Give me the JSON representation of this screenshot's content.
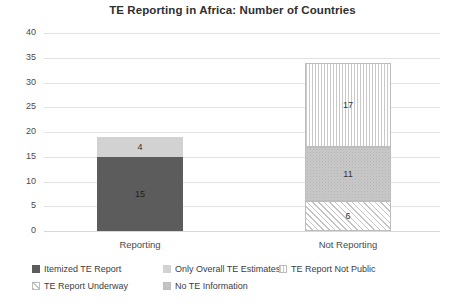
{
  "chart_data": {
    "type": "bar",
    "title": "TE Reporting in Africa: Number of Countries",
    "xlabel": "",
    "ylabel": "",
    "ylim": [
      0,
      40
    ],
    "yticks": [
      "0",
      "5",
      "10",
      "15",
      "20",
      "25",
      "30",
      "35",
      "40"
    ],
    "grid": true,
    "stacked": true,
    "legend_position": "bottom",
    "categories": [
      "Reporting",
      "Not Reporting"
    ],
    "series": [
      {
        "name": "Itemized TE Report",
        "values": [
          15,
          0
        ],
        "swatch": "#5c5c5c",
        "pattern": "solid-dark"
      },
      {
        "name": "Only Overall TE Estimates",
        "values": [
          4,
          0
        ],
        "swatch": "#d2d2d2",
        "pattern": "solid-light"
      },
      {
        "name": "TE Report Not Public",
        "values": [
          0,
          17
        ],
        "swatch": "#ffffff",
        "pattern": "vertical-stripes"
      },
      {
        "name": "TE Report Underway",
        "values": [
          0,
          6
        ],
        "swatch": "#ffffff",
        "pattern": "diagonal-hatch"
      },
      {
        "name": "No TE Information",
        "values": [
          0,
          11
        ],
        "swatch": "#c8c8c8",
        "pattern": "stipple"
      }
    ],
    "bars": [
      {
        "category": "Reporting",
        "total": 19,
        "segments": [
          {
            "label": "15",
            "value": 15,
            "series": "Itemized TE Report",
            "base": 0,
            "fill": "fill-dark"
          },
          {
            "label": "4",
            "value": 4,
            "series": "Only Overall TE Estimates",
            "base": 15,
            "fill": "fill-light"
          }
        ]
      },
      {
        "category": "Not Reporting",
        "total": 34,
        "segments": [
          {
            "label": "6",
            "value": 6,
            "series": "TE Report Underway",
            "base": 0,
            "fill": "fill-diag"
          },
          {
            "label": "11",
            "value": 11,
            "series": "No TE Information",
            "base": 6,
            "fill": "fill-mid"
          },
          {
            "label": "17",
            "value": 17,
            "series": "TE Report Not Public",
            "base": 17,
            "fill": "fill-vstripe"
          }
        ]
      }
    ]
  },
  "legend": {
    "items": [
      {
        "label": "Itemized TE Report"
      },
      {
        "label": "Only Overall TE Estimates"
      },
      {
        "label": "TE Report Not Public"
      },
      {
        "label": "TE Report Underway"
      },
      {
        "label": "No TE Information"
      }
    ]
  }
}
